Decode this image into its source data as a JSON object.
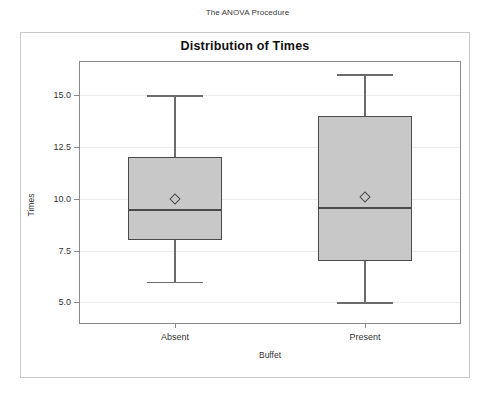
{
  "page": {
    "procedure_header": "The ANOVA Procedure"
  },
  "graph": {
    "title": "Distribution of Times",
    "box_fill_color": "#c8c8c8",
    "box_border_color": "#4a4a4a",
    "gridline_color": "#ededed",
    "axis_color": "#8a8a8a"
  },
  "chart_data": {
    "type": "box",
    "title": "Distribution of Times",
    "xlabel": "Buffet",
    "ylabel": "Times",
    "categories": [
      "Absent",
      "Present"
    ],
    "ylim": [
      4.0,
      16.6
    ],
    "yticks": [
      5.0,
      7.5,
      10.0,
      12.5,
      15.0
    ],
    "ytick_labels": [
      "5.0",
      "7.5",
      "10.0",
      "12.5",
      "15.0"
    ],
    "grid": true,
    "legend": null,
    "mean_marker": "diamond",
    "boxes": [
      {
        "category": "Absent",
        "min": 6.0,
        "q1": 8.0,
        "median": 9.5,
        "q3": 12.0,
        "max": 15.0,
        "mean": 10.0
      },
      {
        "category": "Present",
        "min": 5.0,
        "q1": 7.0,
        "median": 9.6,
        "q3": 14.0,
        "max": 16.0,
        "mean": 10.1
      }
    ]
  }
}
